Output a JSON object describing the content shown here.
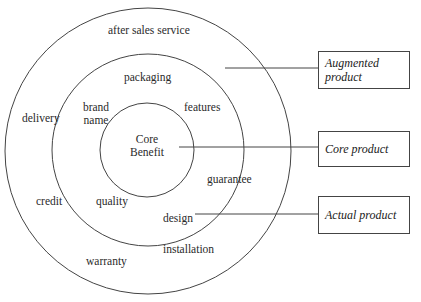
{
  "diagram": {
    "type": "concentric-circles",
    "circles": {
      "outer": {
        "name": "augmented",
        "cx": 148,
        "cy": 151,
        "r": 143
      },
      "middle": {
        "name": "actual",
        "cx": 148,
        "cy": 150,
        "r": 96
      },
      "inner": {
        "name": "core",
        "cx": 147,
        "cy": 150,
        "r": 47
      }
    },
    "core": {
      "line1": "Core",
      "line2": "Benefit"
    },
    "actual_ring_labels": {
      "packaging": "packaging",
      "brand_line1": "brand",
      "brand_line2": "name",
      "features": "features",
      "quality": "quality",
      "design": "design"
    },
    "augmented_ring_labels": {
      "after_sales": "after sales service",
      "delivery": "delivery",
      "credit": "credit",
      "guarantee": "guarantee",
      "installation": "installation",
      "warranty": "warranty"
    },
    "callouts": {
      "augmented": {
        "line1": "Augmented",
        "line2": "product"
      },
      "core": "Core product",
      "actual": "Actual product"
    },
    "stroke_color": "#444444"
  }
}
